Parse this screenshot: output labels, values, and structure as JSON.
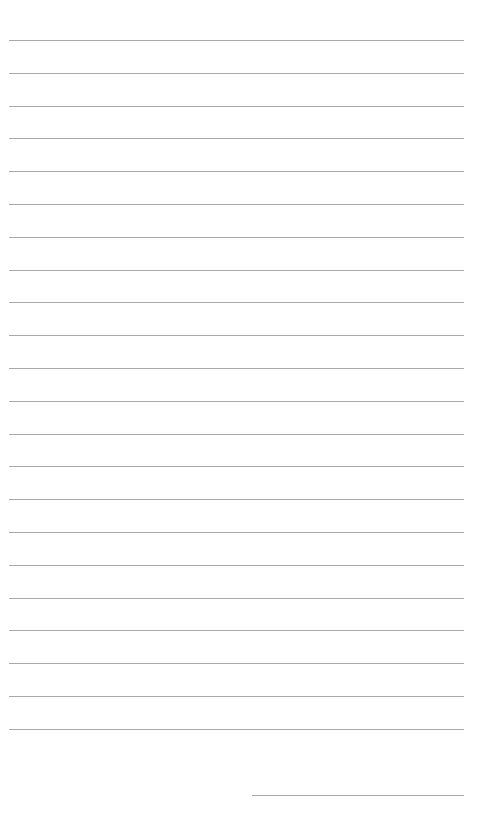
{
  "page": {
    "type": "lined-paper",
    "background_color": "#ffffff",
    "line_color": "#a9a9a9"
  },
  "ruled_lines": {
    "count": 22,
    "first_y": 40,
    "spacing": 32.8,
    "left_x": 9,
    "right_x": 464
  },
  "signature_line": {
    "y": 795,
    "left_x": 252,
    "right_x": 464
  }
}
